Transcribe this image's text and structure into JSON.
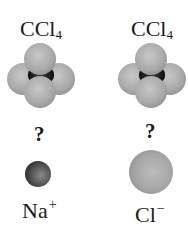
{
  "columns": [
    {
      "molecule_label": {
        "formula_main": "CCl",
        "formula_sub": "4"
      },
      "question_mark": "?",
      "ion_label": {
        "symbol": "Na",
        "charge": "+"
      },
      "ion_size": "small",
      "ion_color": "#4a4a4a"
    },
    {
      "molecule_label": {
        "formula_main": "CCl",
        "formula_sub": "4"
      },
      "question_mark": "?",
      "ion_label": {
        "symbol": "Cl",
        "charge": "−"
      },
      "ion_size": "large",
      "ion_color": "#a8a8a8"
    }
  ],
  "colors": {
    "background": "#ffffff",
    "chlorine_atom": "#a9a9a9",
    "carbon_atom": "#1a1a1a",
    "text": "#1a1a1a"
  }
}
